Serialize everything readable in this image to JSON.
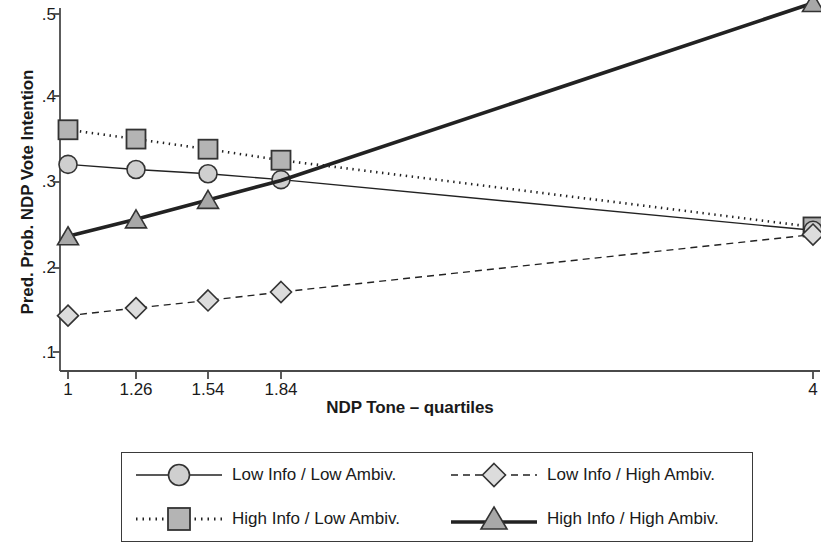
{
  "chart_data": {
    "type": "line",
    "title": "",
    "xlabel": "NDP Tone – quartiles",
    "ylabel": "Pred. Prob. NDP Vote Intention",
    "x": [
      1,
      1.26,
      1.54,
      1.84,
      4
    ],
    "xtick_labels": [
      "1",
      "1.26",
      "1.54",
      "1.84",
      "4"
    ],
    "ytick_labels": [
      ".5",
      ".4",
      ".3",
      ".2",
      ".1"
    ],
    "ytick_values": [
      0.5,
      0.4,
      0.3,
      0.2,
      0.1
    ],
    "ylim": [
      0.08,
      0.515
    ],
    "xlim": [
      0.88,
      4.12
    ],
    "grid": false,
    "legend_position": "below-bottom",
    "series": [
      {
        "name": "Low Info / Low Ambiv.",
        "marker": "circle",
        "line_style": "solid",
        "line_width": 1.4,
        "marker_fill": "#cfcfcf",
        "values": [
          0.322,
          0.316,
          0.311,
          0.304,
          0.244
        ]
      },
      {
        "name": "Low Info / High Ambiv.",
        "marker": "diamond",
        "line_style": "dashed",
        "line_width": 1.4,
        "marker_fill": "#dcdcdc",
        "values": [
          0.143,
          0.152,
          0.161,
          0.171,
          0.239
        ]
      },
      {
        "name": "High Info / Low Ambiv.",
        "marker": "square",
        "line_style": "dotted",
        "line_width": 2.6,
        "marker_fill": "#b4b4b4",
        "values": [
          0.363,
          0.352,
          0.34,
          0.327,
          0.248
        ]
      },
      {
        "name": "High Info / High Ambiv.",
        "marker": "triangle",
        "line_style": "solid",
        "line_width": 3.6,
        "marker_fill": "#a8a8a8",
        "values": [
          0.237,
          0.257,
          0.28,
          0.303,
          0.513
        ]
      }
    ],
    "colors": {
      "axis": "#4a4a4a",
      "line": "#222222",
      "text": "#1a1a1a",
      "background": "#ffffff"
    }
  }
}
